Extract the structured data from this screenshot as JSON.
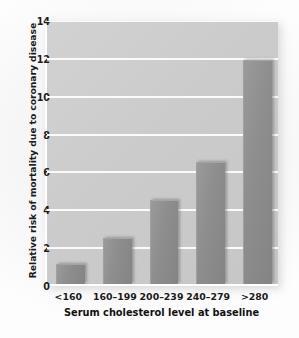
{
  "chart_data": {
    "type": "bar",
    "title": "",
    "categories": [
      "<160",
      "160–199",
      "200–239",
      "240–279",
      ">280"
    ],
    "values": [
      1.0,
      2.4,
      4.4,
      6.4,
      11.8
    ],
    "xlabel": "Serum cholesterol level at baseline",
    "ylabel": "Relative risk of mortality due to coronary disease",
    "ylim": [
      0,
      14
    ],
    "yticks": [
      0,
      2,
      4,
      6,
      8,
      10,
      12,
      14
    ],
    "ytick_labels": [
      "0",
      "2",
      "4",
      "6",
      "8",
      "10",
      "12",
      "14"
    ],
    "grid": true,
    "legend": null,
    "colors": {
      "bar": "#8e8e8e",
      "plot_background": "#cfcfcf",
      "gridline": "#fbfbfb",
      "axis": "#ffffff",
      "text": "#1a1a1a",
      "figure_background": "#f6f6f6"
    }
  }
}
